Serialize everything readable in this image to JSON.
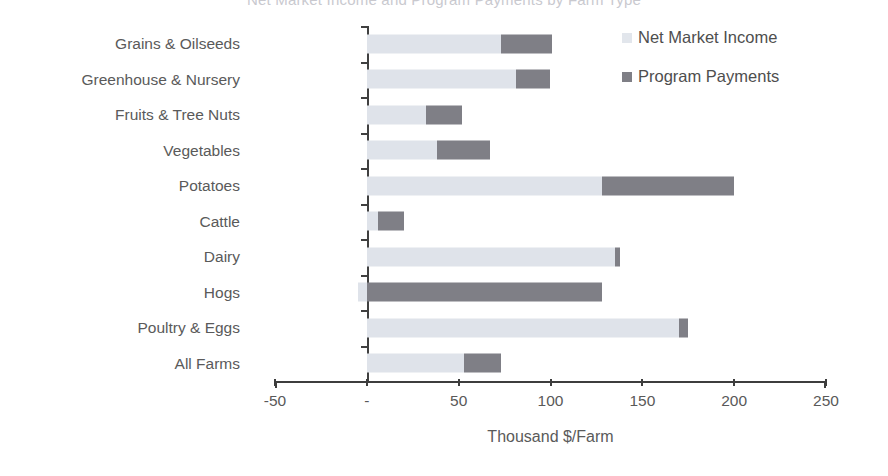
{
  "title_faint": "Net Market Income and Program Payments by Farm Type",
  "legend": {
    "items": [
      {
        "label": "Net Market Income",
        "color": "#e2e6ec",
        "icon": "square-swatch-light"
      },
      {
        "label": "Program Payments",
        "color": "#7f7f86",
        "icon": "square-swatch-dark"
      }
    ]
  },
  "axis": {
    "x_title": "Thousand $/Farm",
    "ticks": [
      "-50",
      "-",
      "50",
      "100",
      "150",
      "200",
      "250"
    ]
  },
  "chart_data": {
    "type": "bar",
    "orientation": "horizontal",
    "stacked": true,
    "title": "Net Market Income and Program Payments by Farm Type",
    "xlabel": "Thousand $/Farm",
    "ylabel": "",
    "xlim": [
      -50,
      250
    ],
    "xticks": [
      -50,
      0,
      50,
      100,
      150,
      200,
      250
    ],
    "xtick_labels": [
      "-50",
      "-",
      "50",
      "100",
      "150",
      "200",
      "250"
    ],
    "grid": false,
    "legend_position": "top-right",
    "categories": [
      "Grains & Oilseeds",
      "Greenhouse & Nursery",
      "Fruits & Tree Nuts",
      "Vegetables",
      "Potatoes",
      "Cattle",
      "Dairy",
      "Hogs",
      "Poultry & Eggs",
      "All Farms"
    ],
    "series": [
      {
        "name": "Net Market Income",
        "color": "#dfe3ea",
        "values": [
          73,
          81,
          32,
          38,
          128,
          6,
          135,
          -5,
          170,
          53
        ]
      },
      {
        "name": "Program Payments",
        "color": "#7f7f86",
        "values": [
          28,
          19,
          20,
          29,
          72,
          14,
          3,
          128,
          5,
          20
        ]
      }
    ],
    "totals": [
      101,
      100,
      52,
      67,
      200,
      20,
      138,
      123,
      175,
      73
    ]
  }
}
